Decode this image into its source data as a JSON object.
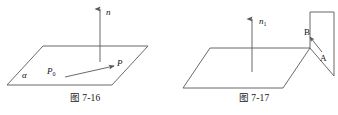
{
  "page": {
    "background_color": "#ffffff",
    "stroke_color": "#58585a",
    "text_color": "#111111",
    "width": 338,
    "height": 115
  },
  "figures": [
    {
      "id": "fig-7-16",
      "caption": "图 7-16",
      "description": "plane alpha with normal vector n and points P0, P",
      "labels": {
        "normal_vector": "n",
        "plane": "α",
        "point_base": "P",
        "point_base_sub": "0",
        "point_end": "P"
      }
    },
    {
      "id": "fig-7-17",
      "caption": "图 7-17",
      "description": "horizontal plane with normal vector n1 and vertical plane carrying points B and A",
      "labels": {
        "normal_vector": "n",
        "normal_vector_sub": "1",
        "point_top": "B",
        "point_bottom": "A"
      }
    }
  ]
}
